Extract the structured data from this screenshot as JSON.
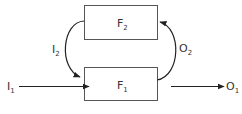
{
  "diagram": {
    "blocks": [
      {
        "id": "F2",
        "label": "F",
        "sub": "2"
      },
      {
        "id": "F1",
        "label": "F",
        "sub": "1"
      }
    ],
    "signals": [
      {
        "id": "I1",
        "label": "I",
        "sub": "1",
        "from": "external",
        "to": "F1"
      },
      {
        "id": "I2",
        "label": "I",
        "sub": "2",
        "from": "F2",
        "to": "F1"
      },
      {
        "id": "O2",
        "label": "O",
        "sub": "2",
        "from": "F1",
        "to": "F2"
      },
      {
        "id": "O1",
        "label": "O",
        "sub": "1",
        "from": "F1",
        "to": "external"
      }
    ]
  }
}
